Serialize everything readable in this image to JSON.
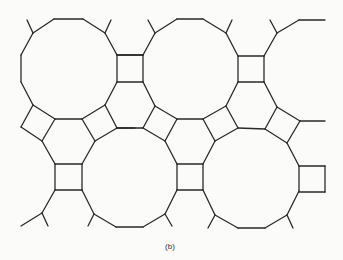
{
  "figure": {
    "caption": "(b)",
    "stroke_color": "#2a2a2a",
    "background_color": "#fbfbfa",
    "edges": [
      [
        54,
        19,
        83,
        19
      ],
      [
        83,
        19,
        105,
        33
      ],
      [
        105,
        33,
        117,
        55
      ],
      [
        117,
        55,
        117,
        82
      ],
      [
        117,
        82,
        105,
        105
      ],
      [
        105,
        105,
        82,
        119
      ],
      [
        82,
        119,
        55,
        119
      ],
      [
        55,
        119,
        33,
        105
      ],
      [
        33,
        105,
        21,
        82
      ],
      [
        21,
        82,
        21,
        55
      ],
      [
        21,
        55,
        33,
        33
      ],
      [
        33,
        33,
        54,
        19
      ],
      [
        33,
        33,
        27,
        20
      ],
      [
        105,
        33,
        111,
        20
      ],
      [
        117,
        55,
        143,
        55
      ],
      [
        143,
        55,
        143,
        82
      ],
      [
        143,
        82,
        117,
        82
      ],
      [
        177,
        19,
        203,
        19
      ],
      [
        203,
        19,
        226,
        33
      ],
      [
        226,
        33,
        238,
        56
      ],
      [
        238,
        56,
        238,
        82
      ],
      [
        238,
        82,
        226,
        106
      ],
      [
        226,
        106,
        203,
        119
      ],
      [
        203,
        119,
        177,
        119
      ],
      [
        177,
        119,
        155,
        106
      ],
      [
        155,
        106,
        143,
        82
      ],
      [
        143,
        55,
        155,
        33
      ],
      [
        155,
        33,
        177,
        19
      ],
      [
        155,
        33,
        148,
        20
      ],
      [
        226,
        33,
        232,
        20
      ],
      [
        143,
        55,
        117,
        55
      ],
      [
        238,
        56,
        264,
        56
      ],
      [
        264,
        56,
        264,
        82
      ],
      [
        264,
        82,
        238,
        82
      ],
      [
        264,
        56,
        277,
        33
      ],
      [
        277,
        33,
        270,
        20
      ],
      [
        277,
        33,
        299,
        20
      ],
      [
        299,
        20,
        325,
        20
      ],
      [
        33,
        105,
        21,
        127
      ],
      [
        21,
        127,
        42,
        141
      ],
      [
        42,
        141,
        55,
        119
      ],
      [
        42,
        141,
        55,
        164
      ],
      [
        55,
        164,
        82,
        164
      ],
      [
        82,
        164,
        95,
        141
      ],
      [
        95,
        141,
        82,
        119
      ],
      [
        105,
        105,
        117,
        128
      ],
      [
        117,
        128,
        95,
        141
      ],
      [
        117,
        128,
        135,
        128
      ],
      [
        117,
        128,
        143,
        128
      ],
      [
        155,
        106,
        143,
        128
      ],
      [
        143,
        128,
        165,
        141
      ],
      [
        165,
        141,
        177,
        119
      ],
      [
        203,
        119,
        215,
        141
      ],
      [
        215,
        141,
        238,
        128
      ],
      [
        238,
        128,
        226,
        106
      ],
      [
        238,
        128,
        265,
        129
      ],
      [
        265,
        129,
        277,
        107
      ],
      [
        277,
        107,
        264,
        82
      ],
      [
        277,
        107,
        300,
        121
      ],
      [
        300,
        121,
        287,
        143
      ],
      [
        287,
        143,
        265,
        129
      ],
      [
        300,
        121,
        325,
        121
      ],
      [
        165,
        141,
        177,
        164
      ],
      [
        177,
        164,
        203,
        164
      ],
      [
        203,
        164,
        215,
        141
      ],
      [
        55,
        164,
        55,
        190
      ],
      [
        55,
        190,
        82,
        190
      ],
      [
        82,
        190,
        82,
        164
      ],
      [
        55,
        190,
        42,
        213
      ],
      [
        42,
        213,
        21,
        226
      ],
      [
        42,
        213,
        48,
        226
      ],
      [
        82,
        190,
        94,
        214
      ],
      [
        94,
        214,
        88,
        226
      ],
      [
        94,
        214,
        116,
        227
      ],
      [
        116,
        227,
        143,
        227
      ],
      [
        143,
        227,
        165,
        214
      ],
      [
        165,
        214,
        172,
        226
      ],
      [
        165,
        214,
        177,
        190
      ],
      [
        177,
        190,
        177,
        164
      ],
      [
        177,
        190,
        203,
        190
      ],
      [
        203,
        190,
        203,
        164
      ],
      [
        203,
        190,
        215,
        215
      ],
      [
        215,
        215,
        208,
        228
      ],
      [
        215,
        215,
        238,
        228
      ],
      [
        238,
        228,
        265,
        228
      ],
      [
        265,
        228,
        287,
        215
      ],
      [
        287,
        215,
        293,
        228
      ],
      [
        287,
        215,
        299,
        191
      ],
      [
        299,
        191,
        299,
        166
      ],
      [
        299,
        166,
        287,
        143
      ],
      [
        299,
        166,
        325,
        166
      ],
      [
        325,
        166,
        325,
        192
      ],
      [
        325,
        192,
        299,
        192
      ]
    ]
  }
}
